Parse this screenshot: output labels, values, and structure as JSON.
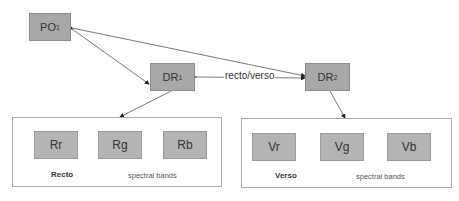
{
  "nodes": {
    "po": {
      "label": "PO",
      "sub": "1"
    },
    "dr1": {
      "label": "DR",
      "sub": "1"
    },
    "dr2": {
      "label": "DR",
      "sub": "2"
    }
  },
  "edge_label": "recto/verso",
  "recto": {
    "title": "Recto",
    "bands_label": "spectral bands",
    "bands": [
      "Rr",
      "Rg",
      "Rb"
    ]
  },
  "verso": {
    "title": "Verso",
    "bands_label": "spectral bands",
    "bands": [
      "Vr",
      "Vg",
      "Vb"
    ]
  },
  "colors": {
    "node_fill": "#a8a8a8",
    "band_fill": "#b4b4b4",
    "line": "#555555"
  }
}
